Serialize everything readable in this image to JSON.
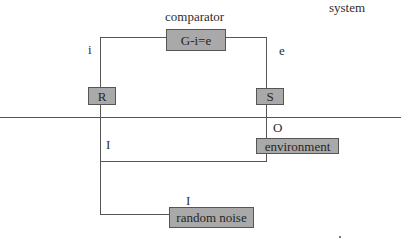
{
  "diagram": {
    "title_label": "system",
    "comparator": {
      "label": "comparator",
      "box_text": "G-i=e"
    },
    "signals": {
      "i": "i",
      "e": "e",
      "I_left": "I",
      "O": "O",
      "I_noise": "I"
    },
    "blocks": {
      "R": "R",
      "S": "S",
      "environment": "environment",
      "random_noise": "random noise"
    },
    "colors": {
      "box_fill": "#a9a9a9",
      "box_border": "#555555",
      "line": "#555555",
      "text": "#2e2e2e"
    }
  }
}
